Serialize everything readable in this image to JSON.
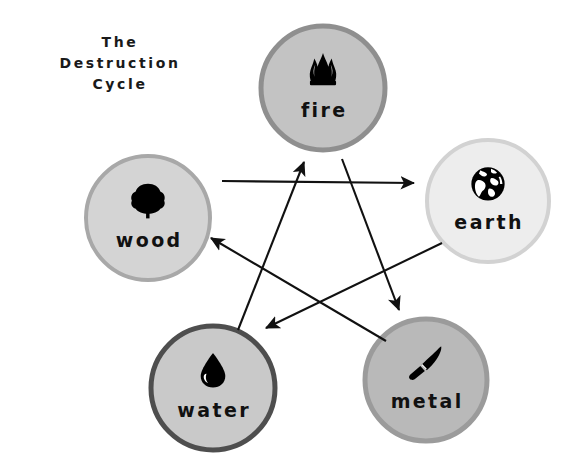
{
  "canvas": {
    "width": 578,
    "height": 474,
    "background": "#ffffff"
  },
  "title": {
    "full": "The Destruction Cycle",
    "lines": [
      "The",
      "Destruction",
      "Cycle"
    ],
    "color": "#1a1a1a"
  },
  "diagram": {
    "type": "cycle-pentagram",
    "nodes": [
      {
        "id": "fire",
        "label": "fire",
        "icon": "flame-icon",
        "cx": 323,
        "cy": 88,
        "r": 62,
        "fill": "#c3c3c3",
        "stroke": "#8f8f8f",
        "stroke_width": 5
      },
      {
        "id": "wood",
        "label": "wood",
        "icon": "tree-icon",
        "cx": 148,
        "cy": 218,
        "r": 62,
        "fill": "#d4d4d4",
        "stroke": "#a8a8a8",
        "stroke_width": 4
      },
      {
        "id": "earth",
        "label": "earth",
        "icon": "globe-icon",
        "cx": 488,
        "cy": 201,
        "r": 61,
        "fill": "#ededed",
        "stroke": "#d2d2d2",
        "stroke_width": 4
      },
      {
        "id": "water",
        "label": "water",
        "icon": "water-drop-icon",
        "cx": 213,
        "cy": 388,
        "r": 62,
        "fill": "#c9c9c9",
        "stroke": "#4e4e4e",
        "stroke_width": 5
      },
      {
        "id": "metal",
        "label": "metal",
        "icon": "knife-icon",
        "cx": 426,
        "cy": 380,
        "r": 61,
        "fill": "#b9b9b9",
        "stroke": "#9b9b9b",
        "stroke_width": 5
      }
    ],
    "arrows": [
      {
        "id": "wood-to-earth",
        "from": "wood",
        "to": "earth",
        "x1": 222,
        "y1": 181,
        "x2": 414,
        "y2": 183
      },
      {
        "id": "earth-to-water",
        "from": "earth",
        "to": "water",
        "x1": 442,
        "y1": 243,
        "x2": 266,
        "y2": 328
      },
      {
        "id": "water-to-fire",
        "from": "water",
        "to": "fire",
        "x1": 238,
        "y1": 330,
        "x2": 304,
        "y2": 162
      },
      {
        "id": "fire-to-metal",
        "from": "fire",
        "to": "metal",
        "x1": 342,
        "y1": 159,
        "x2": 399,
        "y2": 310
      },
      {
        "id": "metal-to-wood",
        "from": "metal",
        "to": "wood",
        "x1": 386,
        "y1": 341,
        "x2": 211,
        "y2": 238
      }
    ],
    "arrow_color": "#111111"
  }
}
